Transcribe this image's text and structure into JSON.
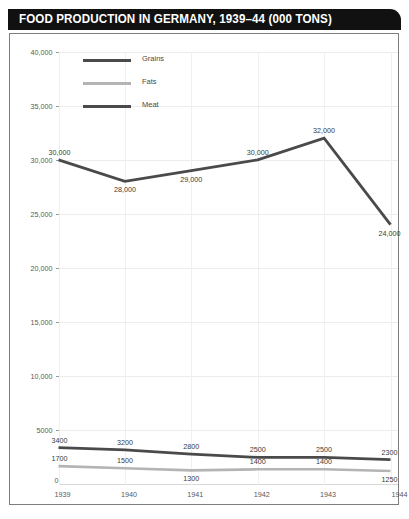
{
  "header": {
    "title": "FOOD PRODUCTION IN GERMANY, 1939–44 (000 TONS)"
  },
  "legend": {
    "position": "top-left-inside",
    "items": [
      {
        "label": "Grains",
        "color": "#4a4a4a"
      },
      {
        "label": "Fats",
        "color": "#b4b4b4"
      },
      {
        "label": "Meat",
        "color": "#4a4a4a"
      }
    ]
  },
  "axes": {
    "y_tick_labels": [
      "40,000",
      "35,000",
      "30,000",
      "25,000",
      "20,000",
      "15,000",
      "10,000",
      "5000"
    ],
    "y_zero_label": "0",
    "x_tick_labels": [
      "1939",
      "1940",
      "1941",
      "1942",
      "1943",
      "1944"
    ]
  },
  "chart_data": {
    "type": "line",
    "title": "FOOD PRODUCTION IN GERMANY, 1939–44 (000 TONS)",
    "xlabel": "",
    "ylabel": "",
    "x": [
      "1939",
      "1940",
      "1941",
      "1942",
      "1943",
      "1944"
    ],
    "categories": [
      "1939",
      "1940",
      "1941",
      "1942",
      "1943",
      "1944"
    ],
    "ylim": [
      0,
      40000
    ],
    "yticks": [
      5000,
      10000,
      15000,
      20000,
      25000,
      30000,
      35000,
      40000
    ],
    "grid": true,
    "legend": "top-left",
    "series": [
      {
        "name": "Grains",
        "color": "#4a4a4a",
        "values": [
          30000,
          28000,
          29000,
          30000,
          32000,
          24000
        ],
        "labels": [
          "30,000",
          "28,000",
          "29,000",
          "30,000",
          "32,000",
          "24,000"
        ],
        "label_positions": [
          "above",
          "below",
          "below",
          "above",
          "above",
          "below"
        ]
      },
      {
        "name": "Meat",
        "color": "#4a4a4a",
        "values": [
          3400,
          3200,
          2800,
          2500,
          2500,
          2300
        ],
        "labels": [
          "3400",
          "3200",
          "2800",
          "2500",
          "2500",
          "2300"
        ],
        "label_positions": [
          "above",
          "above",
          "above",
          "above",
          "above",
          "above"
        ]
      },
      {
        "name": "Fats",
        "color": "#b4b4b4",
        "values": [
          1700,
          1500,
          1300,
          1400,
          1400,
          1250
        ],
        "labels": [
          "1700",
          "1500",
          "1300",
          "1400",
          "1400",
          "1250"
        ],
        "label_positions": [
          "above",
          "above",
          "below",
          "above",
          "above",
          "below"
        ]
      }
    ]
  }
}
